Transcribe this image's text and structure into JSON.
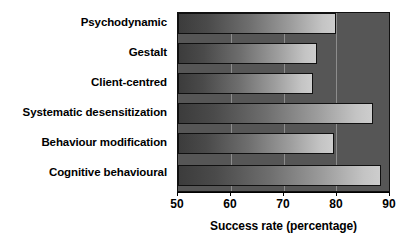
{
  "chart_data": {
    "type": "bar",
    "orientation": "horizontal",
    "title": "",
    "xlabel": "Success rate (percentage)",
    "ylabel": "",
    "xlim": [
      50,
      90
    ],
    "xticks": [
      50,
      60,
      70,
      80,
      90
    ],
    "xtick_labels": [
      "50",
      "60",
      "70",
      "80",
      "90"
    ],
    "grid": true,
    "grid_axis": "x",
    "legend": false,
    "categories": [
      "Psychodynamic",
      "Gestalt",
      "Client-centred",
      "Systematic desensitization",
      "Behaviour modification",
      "Cognitive behavioural"
    ],
    "values": [
      80.0,
      76.3,
      75.5,
      87.0,
      79.5,
      88.4
    ],
    "series": [
      {
        "name": "Success rate",
        "values": [
          80.0,
          76.3,
          75.5,
          87.0,
          79.5,
          88.4
        ]
      }
    ]
  },
  "style": {
    "plot_background": "#565656",
    "gridline_color": "#8d8d8d",
    "bar_gradient_start": "#3c3c3c",
    "bar_gradient_end": "#cdcdcd",
    "bar_border": "#101010",
    "text_color": "#000000",
    "page_background": "#ffffff"
  }
}
